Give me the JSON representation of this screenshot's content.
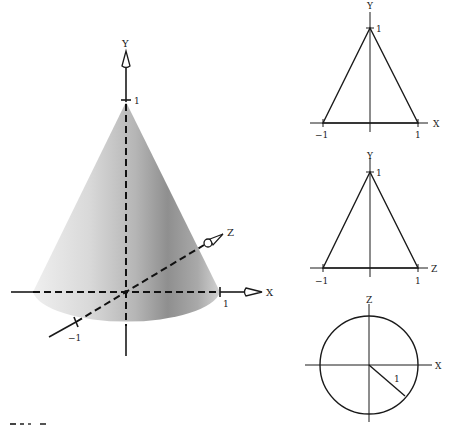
{
  "figure": {
    "main_view": {
      "axes": {
        "x_label": "X",
        "y_label": "Y",
        "z_label": "Z"
      },
      "ticks": {
        "y_top": "1",
        "x_right": "1",
        "z_near": "−1"
      },
      "colors": {
        "cone_light": "#ececec",
        "cone_mid": "#c8c8c8",
        "cone_dark": "#8e8e8e",
        "axis": "#1a1a1a"
      }
    },
    "front_view": {
      "title": "XY projection",
      "horizontal_label": "X",
      "vertical_label": "Y",
      "apex_label": "1",
      "left_label": "−1",
      "right_label": "1"
    },
    "side_view": {
      "title": "ZY projection",
      "horizontal_label": "Z",
      "vertical_label": "Y",
      "apex_label": "1",
      "left_label": "−1",
      "right_label": "1"
    },
    "top_view": {
      "title": "XZ projection",
      "horizontal_label": "X",
      "vertical_label": "Z",
      "radius_label": "1"
    }
  }
}
